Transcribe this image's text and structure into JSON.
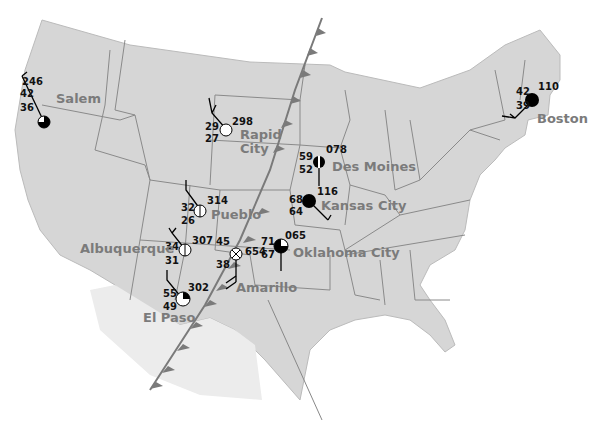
{
  "map": {
    "title": "Surface weather map with station models",
    "colors": {
      "land": "#d6d6d6",
      "border": "#8a8a8a",
      "front": "#7a7a7a",
      "text_city": "#7b7b7b",
      "text_data": "#111111"
    },
    "front": {
      "type": "cold-front",
      "label": ""
    }
  },
  "stations": [
    {
      "city": "Salem",
      "temperature": "42",
      "dewpoint": "36",
      "pressure": "246",
      "sky_cover": "three-quarters",
      "weather": "drizzle"
    },
    {
      "city": "Rapid City",
      "city_line1": "Rapid",
      "city_line2": "City",
      "temperature": "29",
      "dewpoint": "27",
      "pressure": "298",
      "sky_cover": "clear"
    },
    {
      "city": "Des Moines",
      "temperature": "59",
      "dewpoint": "52",
      "pressure": "078",
      "sky_cover": "half"
    },
    {
      "city": "Kansas City",
      "temperature": "68",
      "dewpoint": "64",
      "pressure": "116",
      "sky_cover": "overcast"
    },
    {
      "city": "Pueblo",
      "temperature": "32",
      "dewpoint": "26",
      "pressure": "314",
      "sky_cover": "scattered-line"
    },
    {
      "city": "Albuquerque",
      "temperature": "34",
      "dewpoint": "31",
      "pressure": "307",
      "sky_cover": "scattered-line"
    },
    {
      "city": "Amarillo",
      "temperature": "45",
      "dewpoint": "38",
      "pressure": "654",
      "sky_cover": "obscured",
      "weather": "thunderstorm"
    },
    {
      "city": "Oklahoma City",
      "temperature": "71",
      "dewpoint": "67",
      "pressure": "065",
      "sky_cover": "three-quarters"
    },
    {
      "city": "El Paso",
      "temperature": "55",
      "dewpoint": "49",
      "pressure": "302",
      "sky_cover": "one-quarter"
    },
    {
      "city": "Boston",
      "temperature": "42",
      "dewpoint": "39",
      "pressure": "110",
      "sky_cover": "overcast",
      "weather": "rain"
    }
  ]
}
